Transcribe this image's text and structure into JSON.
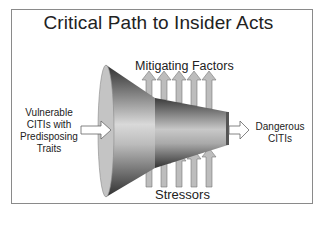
{
  "diagram": {
    "title": "Critical Path to Insider Acts",
    "labels": {
      "top": "Mitigating Factors",
      "bottom": "Stressors",
      "left_lines": [
        "Vulnerable",
        "CITIs with",
        "Predisposing",
        "Traits"
      ],
      "right_lines": [
        "Dangerous",
        "CITIs"
      ]
    },
    "nodes": [
      {
        "id": "input",
        "label": "Vulnerable CITIs with Predisposing Traits"
      },
      {
        "id": "funnel",
        "label": "Critical path funnel"
      },
      {
        "id": "output",
        "label": "Dangerous CITIs"
      }
    ],
    "edges": [
      {
        "from": "input",
        "to": "funnel",
        "type": "arrow"
      },
      {
        "from": "funnel",
        "to": "output",
        "type": "arrow"
      },
      {
        "from": "funnel",
        "to": "Mitigating Factors",
        "type": "up-arrows",
        "count": 5
      },
      {
        "from": "Stressors",
        "to": "funnel",
        "type": "up-arrows",
        "count": 5
      }
    ],
    "colors": {
      "arrow_fill": "#bdbdbd",
      "arrow_stroke": "#7a7a7a",
      "funnel_dark": "#3a3a3a",
      "funnel_light": "#d8d8d8",
      "border": "#8a8a8a"
    }
  }
}
